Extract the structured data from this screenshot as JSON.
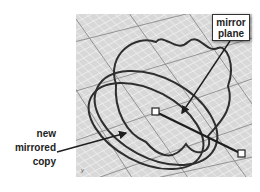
{
  "figure": {
    "callouts": {
      "mirror_plane": {
        "lines": [
          "mirror",
          "plane"
        ]
      },
      "new_copy": {
        "lines": [
          "new",
          "mirrored",
          "copy"
        ]
      }
    },
    "viewport": {
      "axis_label": "y"
    },
    "colors": {
      "grid_bg": "#dcdcdc",
      "grid_minor": "#f2f2f2",
      "grid_major": "#8a8a8a",
      "curve": "#2e2e2e"
    }
  }
}
